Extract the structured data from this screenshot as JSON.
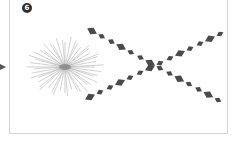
{
  "panel": {
    "step_number": "6",
    "colors": {
      "frame_border": "#d6d6d6",
      "badge_fill": "#2e2e2e",
      "badge_text": "#ffffff",
      "starburst": "#9a9a9a",
      "diamonds": "#4a4a4a"
    }
  },
  "diagram": {
    "starburst": {
      "cx": 65,
      "cy": 67,
      "radius": 40,
      "ray_count": 48
    },
    "diamond_chains": [
      {
        "name": "descending-chain",
        "from": [
          92,
          31
        ],
        "to": [
          218,
          100
        ],
        "count": 14
      },
      {
        "name": "ascending-chain",
        "from": [
          90,
          97
        ],
        "to": [
          220,
          34
        ],
        "count": 14
      }
    ],
    "crossing_point": [
      156,
      65
    ],
    "incoming_arrow": {
      "tip": [
        4,
        67
      ],
      "direction": "right"
    }
  }
}
